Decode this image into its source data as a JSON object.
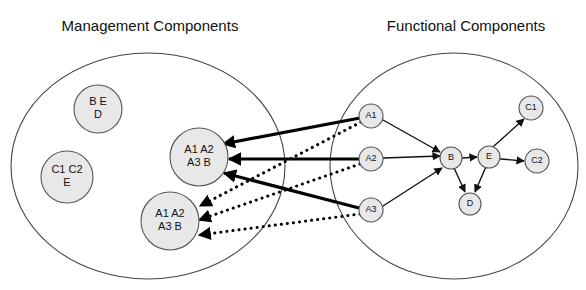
{
  "canvas": {
    "width": 586,
    "height": 290,
    "background": "#ffffff"
  },
  "titles": {
    "management": "Management Components",
    "functional": "Functional Components"
  },
  "groups": [
    {
      "key": "management",
      "label": "Management Components",
      "cx": 148,
      "cy": 166,
      "rx": 137,
      "ry": 113
    },
    {
      "key": "functional",
      "label": "Functional Components",
      "cx": 454,
      "cy": 166,
      "rx": 124,
      "ry": 113
    }
  ],
  "management_nodes": [
    {
      "id": "mgmt-be-d",
      "lines": [
        "B E",
        "D"
      ],
      "cx": 98,
      "cy": 109,
      "r": 24,
      "font": "normal"
    },
    {
      "id": "mgmt-c1c2-e",
      "lines": [
        "C1 C2",
        "E"
      ],
      "cx": 67,
      "cy": 177,
      "r": 26,
      "font": "normal"
    },
    {
      "id": "mgmt-a-upper",
      "lines": [
        "A1 A2",
        "A3 B"
      ],
      "cx": 199,
      "cy": 157,
      "r": 29,
      "font": "normal"
    },
    {
      "id": "mgmt-a-lower",
      "lines": [
        "A1 A2",
        "A3 B"
      ],
      "cx": 170,
      "cy": 221,
      "r": 29,
      "font": "normal"
    }
  ],
  "functional_nodes": [
    {
      "id": "fn-a1",
      "label": "A1",
      "cx": 371,
      "cy": 116,
      "r": 12
    },
    {
      "id": "fn-a2",
      "label": "A2",
      "cx": 371,
      "cy": 159,
      "r": 12
    },
    {
      "id": "fn-a3",
      "label": "A3",
      "cx": 371,
      "cy": 210,
      "r": 12
    },
    {
      "id": "fn-b",
      "label": "B",
      "cx": 451,
      "cy": 158,
      "r": 11
    },
    {
      "id": "fn-e",
      "label": "E",
      "cx": 489,
      "cy": 157,
      "r": 11
    },
    {
      "id": "fn-c1",
      "label": "C1",
      "cx": 531,
      "cy": 108,
      "r": 12
    },
    {
      "id": "fn-c2",
      "label": "C2",
      "cx": 537,
      "cy": 161,
      "r": 12
    },
    {
      "id": "fn-d",
      "label": "D",
      "cx": 470,
      "cy": 204,
      "r": 11
    }
  ],
  "edges_solid_thick": [
    {
      "id": "edge-a1-to-mgmt-upper",
      "from": "fn-a1",
      "to": "mgmt-a-upper",
      "x1": 360,
      "y1": 118,
      "x2": 223,
      "y2": 144,
      "arrow_at": "both"
    },
    {
      "id": "edge-a2-to-mgmt-upper",
      "from": "fn-a2",
      "to": "mgmt-a-upper",
      "x1": 359,
      "y1": 159,
      "x2": 229,
      "y2": 159,
      "arrow_at": "both"
    },
    {
      "id": "edge-a3-to-mgmt-upper",
      "from": "fn-a3",
      "to": "mgmt-a-upper",
      "x1": 359,
      "y1": 208,
      "x2": 224,
      "y2": 173,
      "arrow_at": "both"
    }
  ],
  "edges_dotted": [
    {
      "id": "edge-a1-to-mgmt-lower",
      "from": "fn-a1",
      "to": "mgmt-a-lower",
      "x1": 361,
      "y1": 122,
      "x2": 200,
      "y2": 206,
      "arrow_at": "both"
    },
    {
      "id": "edge-a2-to-mgmt-lower",
      "from": "fn-a2",
      "to": "mgmt-a-lower",
      "x1": 360,
      "y1": 164,
      "x2": 199,
      "y2": 220,
      "arrow_at": "both"
    },
    {
      "id": "edge-a3-to-mgmt-lower",
      "from": "fn-a3",
      "to": "mgmt-a-lower",
      "x1": 360,
      "y1": 214,
      "x2": 199,
      "y2": 235,
      "arrow_at": "both"
    }
  ],
  "edges_internal": [
    {
      "id": "edge-a1-b",
      "from": "fn-a1",
      "to": "fn-b",
      "x1": 383,
      "y1": 120,
      "x2": 440,
      "y2": 152,
      "arrow_at": "both"
    },
    {
      "id": "edge-a2-b",
      "from": "fn-a2",
      "to": "fn-b",
      "x1": 384,
      "y1": 158,
      "x2": 440,
      "y2": 156,
      "arrow_at": "both"
    },
    {
      "id": "edge-a3-b",
      "from": "fn-a3",
      "to": "fn-b",
      "x1": 383,
      "y1": 206,
      "x2": 442,
      "y2": 168,
      "arrow_at": "both"
    },
    {
      "id": "edge-b-e",
      "from": "fn-b",
      "to": "fn-e",
      "x1": 463,
      "y1": 158,
      "x2": 477,
      "y2": 157,
      "arrow_at": "both"
    },
    {
      "id": "edge-b-d",
      "from": "fn-b",
      "to": "fn-d",
      "x1": 455,
      "y1": 170,
      "x2": 465,
      "y2": 192,
      "arrow_at": "both"
    },
    {
      "id": "edge-e-d",
      "from": "fn-e",
      "to": "fn-d",
      "x1": 485,
      "y1": 169,
      "x2": 475,
      "y2": 192,
      "arrow_at": "both"
    },
    {
      "id": "edge-e-c1",
      "from": "fn-e",
      "to": "fn-c1",
      "x1": 494,
      "y1": 146,
      "x2": 524,
      "y2": 119,
      "arrow_at": "both"
    },
    {
      "id": "edge-e-c2",
      "from": "fn-e",
      "to": "fn-c2",
      "x1": 501,
      "y1": 159,
      "x2": 524,
      "y2": 161,
      "arrow_at": "both"
    }
  ]
}
